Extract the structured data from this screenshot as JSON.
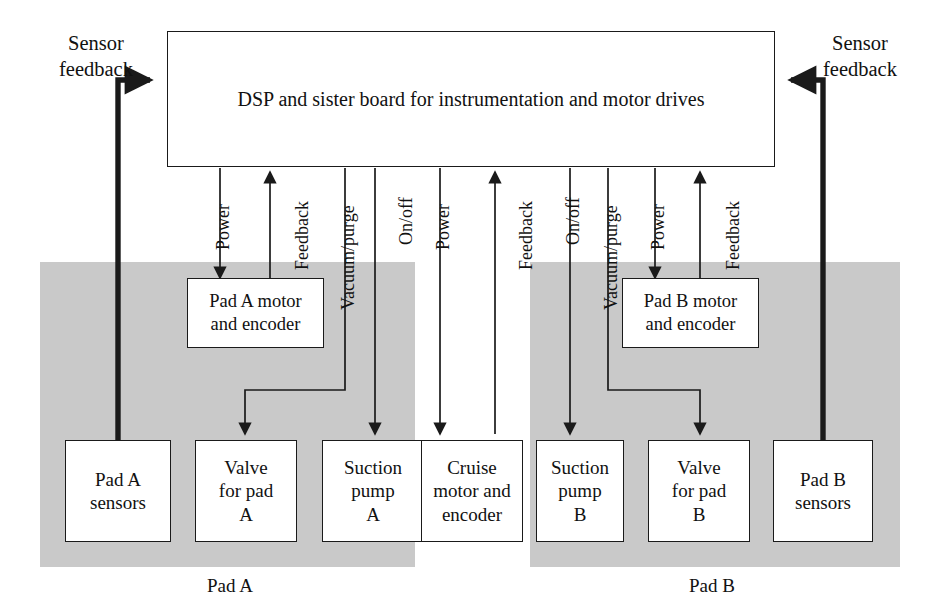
{
  "diagram": {
    "controller": {
      "label": "DSP and sister board for instrumentation and motor drives"
    },
    "side_labels": [
      {
        "id": "sensor-feedback-left",
        "text": "Sensor\nfeedback",
        "line1": "Sensor",
        "line2": "feedback"
      },
      {
        "id": "sensor-feedback-right",
        "text": "Sensor\nfeedback",
        "line1": "Sensor",
        "line2": "feedback"
      }
    ],
    "left_feedback_label_line1": "Sensor",
    "left_feedback_label_line2": "feedback",
    "right_feedback_label_line1": "Sensor",
    "right_feedback_label_line2": "feedback",
    "nodes": {
      "pad_a_motor_line1": "Pad A motor",
      "pad_a_motor_line2": "and encoder",
      "pad_b_motor_line1": "Pad B motor",
      "pad_b_motor_line2": "and encoder",
      "pad_a_sensors_line1": "Pad A",
      "pad_a_sensors_line2": "sensors",
      "valve_a_line1": "Valve",
      "valve_a_line2": "for pad",
      "valve_a_line3": "A",
      "suction_a_line1": "Suction",
      "suction_a_line2": "pump",
      "suction_a_line3": "A",
      "cruise_line1": "Cruise",
      "cruise_line2": "motor and",
      "cruise_line3": "encoder",
      "suction_b_line1": "Suction",
      "suction_b_line2": "pump",
      "suction_b_line3": "B",
      "valve_b_line1": "Valve",
      "valve_b_line2": "for pad",
      "valve_b_line3": "B",
      "pad_b_sensors_line1": "Pad B",
      "pad_b_sensors_line2": "sensors"
    },
    "region_labels": {
      "pad_a": "Pad A",
      "pad_b": "Pad B"
    },
    "wire_labels": {
      "power_a": "Power",
      "feedback_a": "Feedback",
      "vacuum_purge_a": "Vacuum/purge",
      "onoff_a": "On/off",
      "power_cruise": "Power",
      "feedback_cruise": "Feedback",
      "onoff_b": "On/off",
      "vacuum_purge_b": "Vacuum/purge",
      "power_b": "Power",
      "feedback_b": "Feedback"
    },
    "colors": {
      "pad_shade": "#c9c9c9",
      "line": "#1a1a1a",
      "box_fill": "#ffffff",
      "page": "#ffffff"
    }
  }
}
